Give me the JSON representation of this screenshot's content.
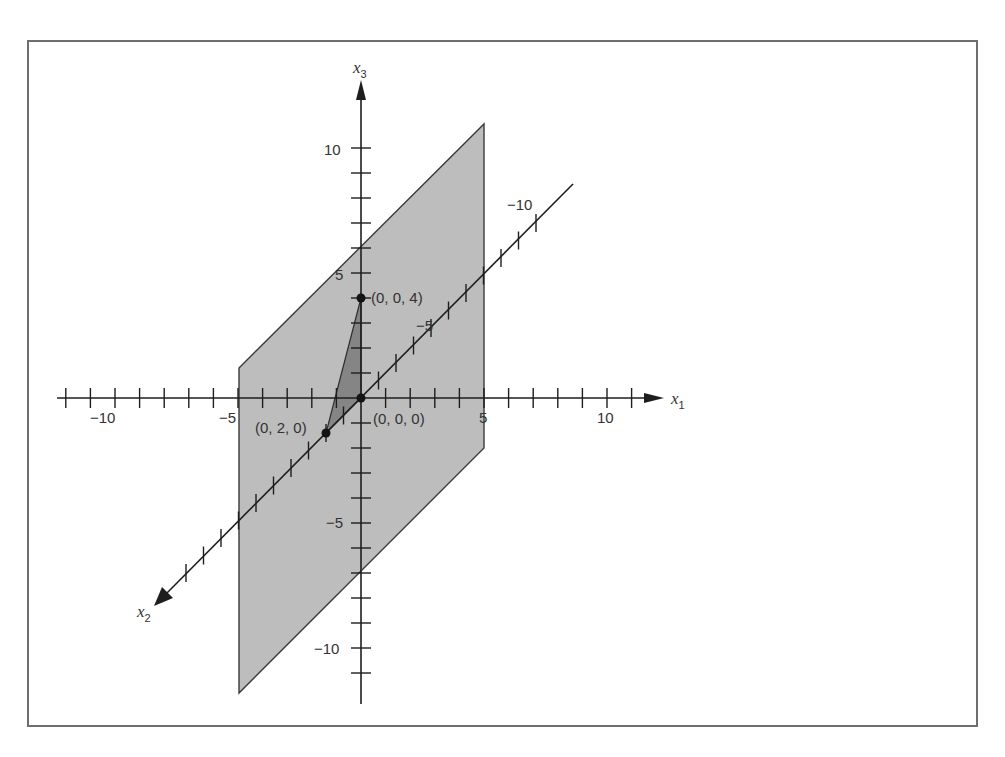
{
  "figure": {
    "title": "",
    "axes": {
      "x1": {
        "label": "x",
        "subscript": "1",
        "tick_labels": [
          "-10",
          "-5",
          "5",
          "10"
        ]
      },
      "x2": {
        "label": "x",
        "subscript": "2",
        "tick_labels": [
          "-5",
          "-10"
        ]
      },
      "x3": {
        "label": "x",
        "subscript": "3",
        "tick_labels": [
          "10",
          "5",
          "-5",
          "-10"
        ]
      }
    },
    "points": [
      {
        "label": "(0, 0, 4)",
        "coords": [
          0,
          0,
          4
        ]
      },
      {
        "label": "(0, 2, 0)",
        "coords": [
          0,
          2,
          0
        ]
      },
      {
        "label": "(0, 0, 0)",
        "coords": [
          0,
          0,
          0
        ]
      }
    ],
    "plane": {
      "description": "Plane x1 = 0 region spanning x1 from -5 to 5, shaded gray",
      "fill": "#bdbdbd"
    },
    "triangle": {
      "vertices": [
        "(0, 0, 4)",
        "(0, 2, 0)",
        "(0, 0, 0)"
      ],
      "fill": "#858585"
    },
    "colors": {
      "axis": "#1e1e1e",
      "frame": "#6e6e6e",
      "plane": "#bdbdbd",
      "triangle": "#858585"
    }
  },
  "chart_data": {
    "type": "diagram-3d-axes",
    "title": "",
    "axes": [
      "x1",
      "x2",
      "x3"
    ],
    "x1_ticks": [
      -10,
      -5,
      5,
      10
    ],
    "x2_ticks": [
      -5,
      -10
    ],
    "x3_ticks": [
      10,
      5,
      -5,
      -10
    ],
    "points": [
      {
        "label": "(0, 0, 4)",
        "x1": 0,
        "x2": 0,
        "x3": 4
      },
      {
        "label": "(0, 2, 0)",
        "x1": 0,
        "x2": 2,
        "x3": 0
      },
      {
        "label": "(0, 0, 0)",
        "x1": 0,
        "x2": 0,
        "x3": 0
      }
    ],
    "shaded_regions": [
      "parallelogram plane (light gray)",
      "triangle with vertices (0,0,4), (0,2,0), (0,0,0) (dark gray)"
    ]
  }
}
